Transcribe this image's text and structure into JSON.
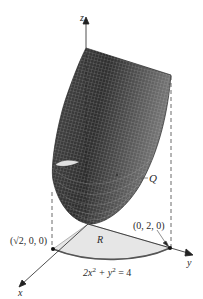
{
  "figure": {
    "type": "3d-surface-over-region",
    "axes": {
      "x_label": "x",
      "y_label": "y",
      "z_label": "z"
    },
    "points": {
      "x_intercept": "(√2, 0, 0)",
      "y_intercept": "(0, 2, 0)"
    },
    "region": {
      "label": "R",
      "boundary_lhs": "2x",
      "boundary_exp1": "2",
      "boundary_mid": " + y",
      "boundary_exp2": "2",
      "boundary_rhs": " = 4"
    },
    "surface": {
      "label": "Q"
    },
    "colors": {
      "surface_dark": "#3a3a3a",
      "surface_mid": "#6e6e6e",
      "mesh": "#1e1e1e",
      "region_fill": "#e6e6e6",
      "boundary_curve": "#555555",
      "axis": "#222222"
    }
  }
}
